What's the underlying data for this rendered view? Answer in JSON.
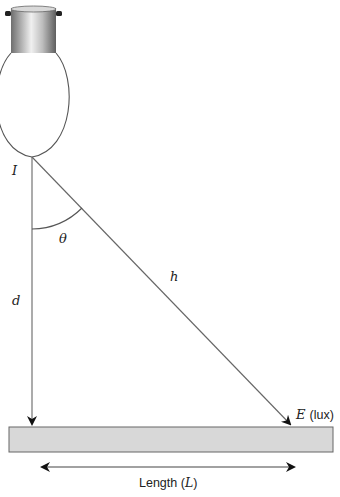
{
  "diagram": {
    "type": "illuminance-geometry",
    "labels": {
      "intensity": "I",
      "angle": "θ",
      "hypotenuse": "h",
      "distance": "d",
      "illuminance_var": "E",
      "illuminance_unit": "(lux)",
      "length_prefix": "Length (",
      "length_var": "L",
      "length_suffix": ")"
    },
    "colors": {
      "line": "#555555",
      "arrowhead": "#111111",
      "surface_fill": "#d8d8d8",
      "surface_stroke": "#666666",
      "cap_dark": "#6e6e6e",
      "cap_light": "#e8e8e8",
      "bulb_stroke": "#555555"
    }
  }
}
